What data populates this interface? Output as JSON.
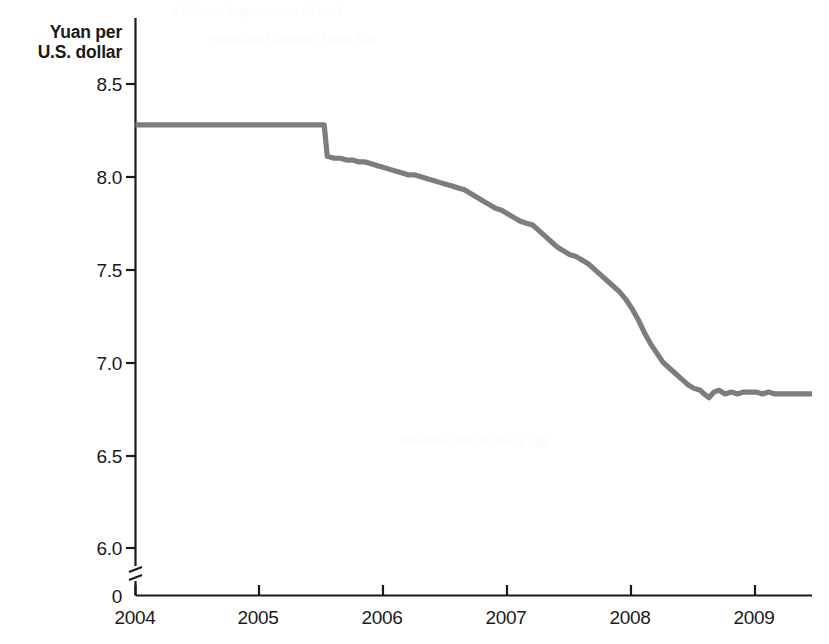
{
  "chart_data": {
    "type": "line",
    "title": "",
    "subtitle": "",
    "ylabel_line1": "Yuan per",
    "ylabel_line2": "U.S. dollar",
    "xlabel": "",
    "ytick_labels": [
      "8.5",
      "8.0",
      "7.5",
      "7.0",
      "6.5",
      "6.0",
      "0"
    ],
    "ytick_values": [
      8.5,
      8.0,
      7.5,
      7.0,
      6.5,
      6.0,
      0
    ],
    "ylim": [
      5.85,
      8.7
    ],
    "y_axis_break": true,
    "y_axis_break_note": "axis broken between 0 and 6.0",
    "xtick_labels": [
      "2004",
      "2005",
      "2006",
      "2007",
      "2008",
      "2009"
    ],
    "xtick_values": [
      2004,
      2005,
      2006,
      2007,
      2008,
      2009
    ],
    "xlim": [
      2004.0,
      2009.45
    ],
    "grid": false,
    "legend": false,
    "legend_position": "none",
    "line_color": "#7d7d7d",
    "axis_color": "#1a1a1a",
    "series": [
      {
        "name": "Yuan per U.S. dollar",
        "x": [
          2004.0,
          2004.1,
          2004.2,
          2004.3,
          2004.4,
          2004.5,
          2004.6,
          2004.7,
          2004.8,
          2004.9,
          2005.0,
          2005.1,
          2005.2,
          2005.3,
          2005.4,
          2005.52,
          2005.545,
          2005.55,
          2005.6,
          2005.65,
          2005.7,
          2005.75,
          2005.8,
          2005.85,
          2005.9,
          2005.95,
          2006.0,
          2006.05,
          2006.1,
          2006.15,
          2006.2,
          2006.25,
          2006.3,
          2006.35,
          2006.4,
          2006.45,
          2006.5,
          2006.55,
          2006.6,
          2006.65,
          2006.7,
          2006.75,
          2006.8,
          2006.85,
          2006.9,
          2006.95,
          2007.0,
          2007.05,
          2007.1,
          2007.15,
          2007.2,
          2007.25,
          2007.3,
          2007.35,
          2007.4,
          2007.45,
          2007.5,
          2007.55,
          2007.6,
          2007.65,
          2007.7,
          2007.75,
          2007.8,
          2007.85,
          2007.9,
          2007.95,
          2008.0,
          2008.05,
          2008.1,
          2008.15,
          2008.2,
          2008.25,
          2008.3,
          2008.35,
          2008.4,
          2008.45,
          2008.5,
          2008.55,
          2008.58,
          2008.62,
          2008.66,
          2008.7,
          2008.75,
          2008.8,
          2008.85,
          2008.9,
          2008.95,
          2009.0,
          2009.05,
          2009.1,
          2009.15,
          2009.2,
          2009.25,
          2009.3,
          2009.35,
          2009.4,
          2009.45
        ],
        "y": [
          8.28,
          8.28,
          8.28,
          8.28,
          8.28,
          8.28,
          8.28,
          8.28,
          8.28,
          8.28,
          8.28,
          8.28,
          8.28,
          8.28,
          8.28,
          8.28,
          8.11,
          8.11,
          8.1,
          8.1,
          8.09,
          8.09,
          8.08,
          8.08,
          8.07,
          8.06,
          8.05,
          8.04,
          8.03,
          8.02,
          8.01,
          8.01,
          8.0,
          7.99,
          7.98,
          7.97,
          7.96,
          7.95,
          7.94,
          7.93,
          7.91,
          7.89,
          7.87,
          7.85,
          7.83,
          7.82,
          7.8,
          7.78,
          7.76,
          7.75,
          7.74,
          7.71,
          7.68,
          7.65,
          7.62,
          7.6,
          7.58,
          7.57,
          7.55,
          7.53,
          7.5,
          7.47,
          7.44,
          7.41,
          7.38,
          7.34,
          7.29,
          7.23,
          7.16,
          7.1,
          7.05,
          7.0,
          6.97,
          6.94,
          6.91,
          6.88,
          6.86,
          6.85,
          6.83,
          6.81,
          6.84,
          6.85,
          6.83,
          6.84,
          6.83,
          6.84,
          6.84,
          6.84,
          6.83,
          6.84,
          6.83,
          6.83,
          6.83,
          6.83,
          6.83,
          6.83,
          6.83
        ]
      }
    ],
    "annotations": [
      {
        "text": "peg at 8.28 yuan per dollar held through mid-2005",
        "x": 2004.7,
        "y": 8.28
      },
      {
        "text": "revaluation step to 8.11 in July 2005",
        "x": 2005.55,
        "y": 8.11
      },
      {
        "text": "appreciation flattens near 6.83 from mid-2008",
        "x": 2009.0,
        "y": 6.83
      }
    ]
  },
  "bleed_through": {
    "lines": [
      "a fainter impression of text",
      "showing through from the",
      "reverse side of the page"
    ]
  }
}
